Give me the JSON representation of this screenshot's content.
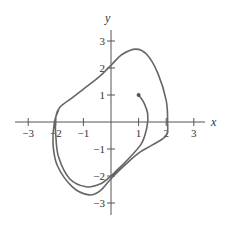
{
  "chart_data": {
    "type": "line",
    "title": "",
    "xlabel": "x",
    "ylabel": "y",
    "xlim": [
      -3.5,
      3.8
    ],
    "ylim": [
      -3.5,
      3.5
    ],
    "grid": false,
    "x_ticks": [
      -3,
      -2,
      -1,
      1,
      2,
      3
    ],
    "y_ticks": [
      -3,
      -2,
      -1,
      1,
      2,
      3
    ],
    "x_tick_labels": [
      "−3",
      "−2",
      "−1",
      "1",
      "2",
      "3"
    ],
    "y_tick_labels": [
      "−3",
      "−2",
      "−1",
      "1",
      "2",
      "3"
    ],
    "series": [
      {
        "name": "trajectory",
        "start_point": [
          1,
          1
        ],
        "points": [
          [
            1.0,
            1.0
          ],
          [
            1.2,
            0.7
          ],
          [
            1.33,
            0.3
          ],
          [
            1.3,
            -0.2
          ],
          [
            1.1,
            -0.8
          ],
          [
            0.6,
            -1.4
          ],
          [
            0.2,
            -1.8
          ],
          [
            0.0,
            -2.0
          ],
          [
            -0.4,
            -2.3
          ],
          [
            -0.9,
            -2.4
          ],
          [
            -1.5,
            -2.1
          ],
          [
            -1.9,
            -1.3
          ],
          [
            -2.0,
            -0.5
          ],
          [
            -2.0,
            0.2
          ],
          [
            -1.85,
            0.55
          ],
          [
            -1.4,
            0.9
          ],
          [
            -0.9,
            1.3
          ],
          [
            -0.4,
            1.7
          ],
          [
            0.0,
            2.1
          ],
          [
            0.4,
            2.5
          ],
          [
            0.9,
            2.7
          ],
          [
            1.3,
            2.5
          ],
          [
            1.7,
            1.8
          ],
          [
            2.0,
            0.8
          ],
          [
            2.05,
            0.0
          ],
          [
            2.0,
            -0.5
          ],
          [
            1.5,
            -0.85
          ],
          [
            1.0,
            -1.15
          ],
          [
            0.5,
            -1.6
          ],
          [
            0.0,
            -2.1
          ],
          [
            -0.4,
            -2.55
          ],
          [
            -0.8,
            -2.7
          ],
          [
            -1.4,
            -2.4
          ],
          [
            -1.95,
            -1.6
          ],
          [
            -2.1,
            -0.8
          ],
          [
            -2.05,
            0.0
          ],
          [
            -1.9,
            0.45
          ]
        ]
      }
    ]
  },
  "labels": {
    "x_axis": "x",
    "y_axis": "y"
  }
}
